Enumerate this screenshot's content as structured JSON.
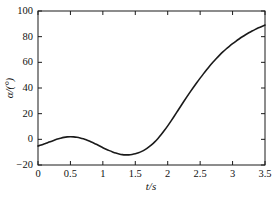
{
  "figure": {
    "background_color": "#ffffff",
    "axis_color": "#1a1a1a",
    "line_color": "#1a1a1a"
  },
  "chart_data": {
    "type": "line",
    "title": "",
    "subtitle": "",
    "xlabel": "t/s",
    "ylabel": "α/(°)",
    "xlim": [
      0,
      3.5
    ],
    "ylim": [
      -20,
      100
    ],
    "xticks": [
      0,
      0.5,
      1,
      1.5,
      2,
      2.5,
      3,
      3.5
    ],
    "xtick_labels": [
      "0",
      "0.5",
      "1",
      "1.5",
      "2",
      "2.5",
      "3",
      "3.5"
    ],
    "yticks": [
      -20,
      0,
      20,
      40,
      60,
      80,
      100
    ],
    "ytick_labels": [
      "−20",
      "0",
      "20",
      "40",
      "60",
      "80",
      "100"
    ],
    "grid": false,
    "legend": null,
    "legend_position": "none",
    "annotations": [],
    "series": [
      {
        "name": "alpha",
        "line_width": 1.6,
        "color": "#1a1a1a",
        "x": [
          0.0,
          0.05,
          0.1,
          0.15,
          0.2,
          0.25,
          0.3,
          0.35,
          0.4,
          0.45,
          0.5,
          0.55,
          0.6,
          0.65,
          0.7,
          0.75,
          0.8,
          0.85,
          0.9,
          0.95,
          1.0,
          1.05,
          1.1,
          1.15,
          1.2,
          1.25,
          1.3,
          1.35,
          1.4,
          1.45,
          1.5,
          1.55,
          1.6,
          1.65,
          1.7,
          1.75,
          1.8,
          1.85,
          1.9,
          1.95,
          2.0,
          2.05,
          2.1,
          2.15,
          2.2,
          2.25,
          2.3,
          2.35,
          2.4,
          2.45,
          2.5,
          2.55,
          2.6,
          2.65,
          2.7,
          2.75,
          2.8,
          2.85,
          2.9,
          2.95,
          3.0,
          3.05,
          3.1,
          3.15,
          3.2,
          3.25,
          3.3,
          3.35,
          3.4,
          3.45,
          3.5
        ],
        "y": [
          -5.2,
          -4.4,
          -3.5,
          -2.6,
          -1.6,
          -0.7,
          0.2,
          0.9,
          1.5,
          1.9,
          2.0,
          1.9,
          1.6,
          1.1,
          0.4,
          -0.5,
          -1.5,
          -2.7,
          -3.9,
          -5.2,
          -6.5,
          -7.7,
          -8.8,
          -9.8,
          -10.7,
          -11.4,
          -11.9,
          -12.1,
          -12.1,
          -11.8,
          -11.3,
          -10.5,
          -9.4,
          -8.0,
          -6.3,
          -4.3,
          -2.0,
          0.7,
          3.7,
          7.0,
          10.5,
          14.2,
          18.0,
          21.9,
          25.8,
          29.7,
          33.5,
          37.2,
          40.8,
          44.3,
          47.7,
          51.0,
          54.2,
          57.3,
          60.2,
          63.0,
          65.6,
          68.1,
          70.4,
          72.5,
          74.5,
          76.4,
          78.2,
          79.9,
          81.5,
          83.0,
          84.4,
          85.7,
          86.9,
          88.0,
          89.0
        ]
      }
    ]
  },
  "axes_geometry": {
    "left_px": 38,
    "right_px": 265,
    "top_px": 11,
    "bottom_px": 165
  }
}
